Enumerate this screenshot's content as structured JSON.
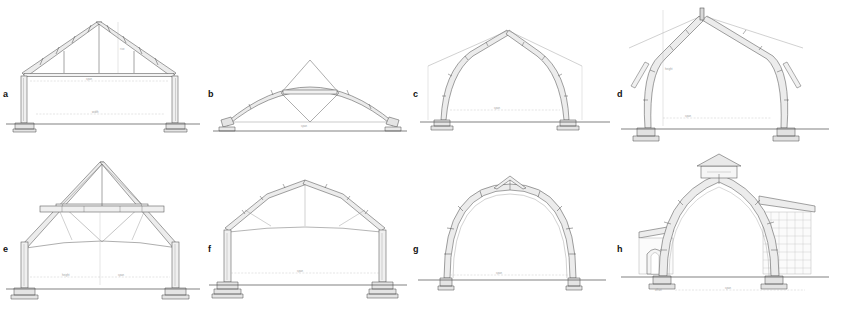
{
  "figure": {
    "kind": "architectural-drawing-plate",
    "background_color": "#ffffff",
    "ink_color": "#3b3b3b",
    "line_color": "#707070",
    "dim_color": "#a8a8a8",
    "shade_color": "#e9e9e9",
    "rows": 2,
    "columns": 4
  },
  "panels": [
    {
      "id": "a",
      "label": "a",
      "title": "Triangular king-post roof truss on tall posts",
      "type": "gabled-truss",
      "notes": "Steep symmetrical A-frame rafters with jointed purlins, horizontal tie beam, two vertical queen struts, carried on slender posts with stepped stone footings.",
      "dimensions": [
        {
          "name": "tie-beam-span",
          "text": "span",
          "orientation": "horizontal"
        },
        {
          "name": "rafter-rise",
          "text": "rise",
          "orientation": "vertical"
        },
        {
          "name": "overall-width",
          "text": "width",
          "orientation": "horizontal"
        }
      ]
    },
    {
      "id": "b",
      "label": "b",
      "title": "Shallow segmental bowed arch with apex lozenge",
      "type": "segmental-arch",
      "notes": "Low flat-sprung laminated arch rib; a diamond-shaped king frame straddles the crown and drops to the tie line; splayed feet on low pads.",
      "dimensions": [
        {
          "name": "chord-span",
          "text": "span",
          "orientation": "horizontal"
        }
      ]
    },
    {
      "id": "c",
      "label": "c",
      "title": "Pointed cruck arch with straight upper rafters",
      "type": "pointed-cruck",
      "notes": "Curved blades rise from ground pads and turn into straight rafters meeting at a pointed apex; jointed segments pegged along the curve; short eaves struts.",
      "dimensions": [
        {
          "name": "clear-span",
          "text": "span",
          "orientation": "horizontal"
        },
        {
          "name": "eaves-height",
          "text": "height",
          "orientation": "vertical"
        }
      ]
    },
    {
      "id": "d",
      "label": "d",
      "title": "Tall cruck frame with curved blades and ridge post",
      "type": "cruck-frame",
      "notes": "High pointed gable; curved cruck blades spring from massive stepped stone bases, swell at the elbow and carry straight rafters to a short ridge post.",
      "dimensions": [
        {
          "name": "apex-height",
          "text": "height",
          "orientation": "vertical"
        },
        {
          "name": "bay-span",
          "text": "span",
          "orientation": "horizontal"
        }
      ]
    },
    {
      "id": "e",
      "label": "e",
      "title": "King-post truss over a cambered barrel tie",
      "type": "king-post-truss",
      "notes": "Upper triangle with king post and paired diagonal struts forming a diamond above a deep collar beam; below it a shallow cambered arched ceiling tie spans between posts.",
      "dimensions": [
        {
          "name": "floor-span",
          "text": "span",
          "orientation": "horizontal"
        },
        {
          "name": "post-height",
          "text": "height",
          "orientation": "vertical"
        }
      ]
    },
    {
      "id": "f",
      "label": "f",
      "title": "Canted polygonal roof on tall slender posts",
      "type": "polygonal-roof",
      "notes": "Shallow hipped-profile roof of straight canted members with knee braces and a slight cambered tie; carried on tall thin columns set on broad stepped bases.",
      "dimensions": [
        {
          "name": "clear-span",
          "text": "span",
          "orientation": "horizontal"
        }
      ]
    },
    {
      "id": "g",
      "label": "g",
      "title": "Near-semicircular laminated arch rib",
      "type": "semicircular-arch",
      "notes": "Deep two-ply laminated rib forming almost a full half-circle, bolted at regular joints, with a small triangular ridge cap at the crown; springs from small pad footings.",
      "dimensions": [
        {
          "name": "springing-span",
          "text": "span",
          "orientation": "horizontal"
        }
      ]
    },
    {
      "id": "h",
      "label": "h",
      "title": "Pointed ogival arch with ridge lantern and aisles",
      "type": "ogival-arch",
      "notes": "Tall pointed two-centred arch crowned by a small gabled lantern; lean-to aisle roofs abut each side, the right one backed by a fine glazing lattice, the left containing a small arched doorway.",
      "dimensions": [
        {
          "name": "overall-span",
          "text": "span",
          "orientation": "horizontal"
        },
        {
          "name": "aisle-offset",
          "text": "offset",
          "orientation": "horizontal"
        }
      ]
    }
  ]
}
